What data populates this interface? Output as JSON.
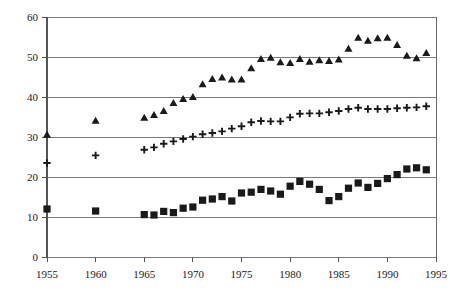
{
  "chart_data": {
    "type": "scatter",
    "title": "",
    "subtitle": "",
    "xlabel": "",
    "ylabel": "",
    "xlim": [
      1955,
      1995
    ],
    "ylim": [
      0,
      60
    ],
    "grid": true,
    "legend": "none",
    "x_ticks": [
      1955,
      1960,
      1965,
      1970,
      1975,
      1980,
      1985,
      1990,
      1995
    ],
    "y_ticks": [
      0,
      10,
      20,
      30,
      40,
      50,
      60
    ],
    "x_tick_labels": [
      "1955",
      "1960",
      "1965",
      "1970",
      "1975",
      "1980",
      "1985",
      "1990",
      "1995"
    ],
    "y_tick_labels": [
      "0",
      "10",
      "20",
      "30",
      "40",
      "50",
      "60"
    ],
    "series": [
      {
        "name": "triangle-series",
        "marker": "triangle",
        "color": "#1a1a1a",
        "points": [
          {
            "x": 1955,
            "y": 30.5
          },
          {
            "x": 1960,
            "y": 34.0
          },
          {
            "x": 1965,
            "y": 34.7
          },
          {
            "x": 1966,
            "y": 35.4
          },
          {
            "x": 1967,
            "y": 36.4
          },
          {
            "x": 1968,
            "y": 38.4
          },
          {
            "x": 1969,
            "y": 39.4
          },
          {
            "x": 1970,
            "y": 39.9
          },
          {
            "x": 1971,
            "y": 43.1
          },
          {
            "x": 1972,
            "y": 44.4
          },
          {
            "x": 1973,
            "y": 44.8
          },
          {
            "x": 1974,
            "y": 44.3
          },
          {
            "x": 1975,
            "y": 44.3
          },
          {
            "x": 1976,
            "y": 47.1
          },
          {
            "x": 1977,
            "y": 49.4
          },
          {
            "x": 1978,
            "y": 49.7
          },
          {
            "x": 1979,
            "y": 48.6
          },
          {
            "x": 1980,
            "y": 48.4
          },
          {
            "x": 1981,
            "y": 49.4
          },
          {
            "x": 1982,
            "y": 48.7
          },
          {
            "x": 1983,
            "y": 49.1
          },
          {
            "x": 1984,
            "y": 48.9
          },
          {
            "x": 1985,
            "y": 49.3
          },
          {
            "x": 1986,
            "y": 52.0
          },
          {
            "x": 1987,
            "y": 54.7
          },
          {
            "x": 1988,
            "y": 54.0
          },
          {
            "x": 1989,
            "y": 54.6
          },
          {
            "x": 1990,
            "y": 54.7
          },
          {
            "x": 1991,
            "y": 52.9
          },
          {
            "x": 1992,
            "y": 50.2
          },
          {
            "x": 1993,
            "y": 49.6
          },
          {
            "x": 1994,
            "y": 50.9
          }
        ]
      },
      {
        "name": "plus-series",
        "marker": "plus",
        "color": "#1a1a1a",
        "points": [
          {
            "x": 1955,
            "y": 23.5
          },
          {
            "x": 1960,
            "y": 25.4
          },
          {
            "x": 1965,
            "y": 26.8
          },
          {
            "x": 1966,
            "y": 27.4
          },
          {
            "x": 1967,
            "y": 28.3
          },
          {
            "x": 1968,
            "y": 28.9
          },
          {
            "x": 1969,
            "y": 29.5
          },
          {
            "x": 1970,
            "y": 30.1
          },
          {
            "x": 1971,
            "y": 30.7
          },
          {
            "x": 1972,
            "y": 31.0
          },
          {
            "x": 1973,
            "y": 31.4
          },
          {
            "x": 1974,
            "y": 32.1
          },
          {
            "x": 1975,
            "y": 32.7
          },
          {
            "x": 1976,
            "y": 33.7
          },
          {
            "x": 1977,
            "y": 34.0
          },
          {
            "x": 1978,
            "y": 33.9
          },
          {
            "x": 1979,
            "y": 33.9
          },
          {
            "x": 1980,
            "y": 34.9
          },
          {
            "x": 1981,
            "y": 35.8
          },
          {
            "x": 1982,
            "y": 35.9
          },
          {
            "x": 1983,
            "y": 35.9
          },
          {
            "x": 1984,
            "y": 36.2
          },
          {
            "x": 1985,
            "y": 36.5
          },
          {
            "x": 1986,
            "y": 37.0
          },
          {
            "x": 1987,
            "y": 37.3
          },
          {
            "x": 1988,
            "y": 37.0
          },
          {
            "x": 1989,
            "y": 37.0
          },
          {
            "x": 1990,
            "y": 37.0
          },
          {
            "x": 1991,
            "y": 37.2
          },
          {
            "x": 1992,
            "y": 37.3
          },
          {
            "x": 1993,
            "y": 37.4
          },
          {
            "x": 1994,
            "y": 37.7
          }
        ]
      },
      {
        "name": "square-series",
        "marker": "square",
        "color": "#1a1a1a",
        "points": [
          {
            "x": 1955,
            "y": 12.0
          },
          {
            "x": 1960,
            "y": 11.5
          },
          {
            "x": 1965,
            "y": 10.6
          },
          {
            "x": 1966,
            "y": 10.5
          },
          {
            "x": 1967,
            "y": 11.4
          },
          {
            "x": 1968,
            "y": 11.1
          },
          {
            "x": 1969,
            "y": 12.2
          },
          {
            "x": 1970,
            "y": 12.5
          },
          {
            "x": 1971,
            "y": 14.2
          },
          {
            "x": 1972,
            "y": 14.5
          },
          {
            "x": 1973,
            "y": 15.1
          },
          {
            "x": 1974,
            "y": 14.0
          },
          {
            "x": 1975,
            "y": 16.0
          },
          {
            "x": 1976,
            "y": 16.2
          },
          {
            "x": 1977,
            "y": 16.9
          },
          {
            "x": 1978,
            "y": 16.5
          },
          {
            "x": 1979,
            "y": 15.7
          },
          {
            "x": 1980,
            "y": 17.7
          },
          {
            "x": 1981,
            "y": 18.9
          },
          {
            "x": 1982,
            "y": 18.2
          },
          {
            "x": 1983,
            "y": 16.9
          },
          {
            "x": 1984,
            "y": 14.1
          },
          {
            "x": 1985,
            "y": 15.1
          },
          {
            "x": 1986,
            "y": 17.2
          },
          {
            "x": 1987,
            "y": 18.5
          },
          {
            "x": 1988,
            "y": 17.4
          },
          {
            "x": 1989,
            "y": 18.4
          },
          {
            "x": 1990,
            "y": 19.6
          },
          {
            "x": 1991,
            "y": 20.6
          },
          {
            "x": 1992,
            "y": 22.0
          },
          {
            "x": 1993,
            "y": 22.3
          },
          {
            "x": 1994,
            "y": 21.8
          }
        ]
      }
    ]
  }
}
